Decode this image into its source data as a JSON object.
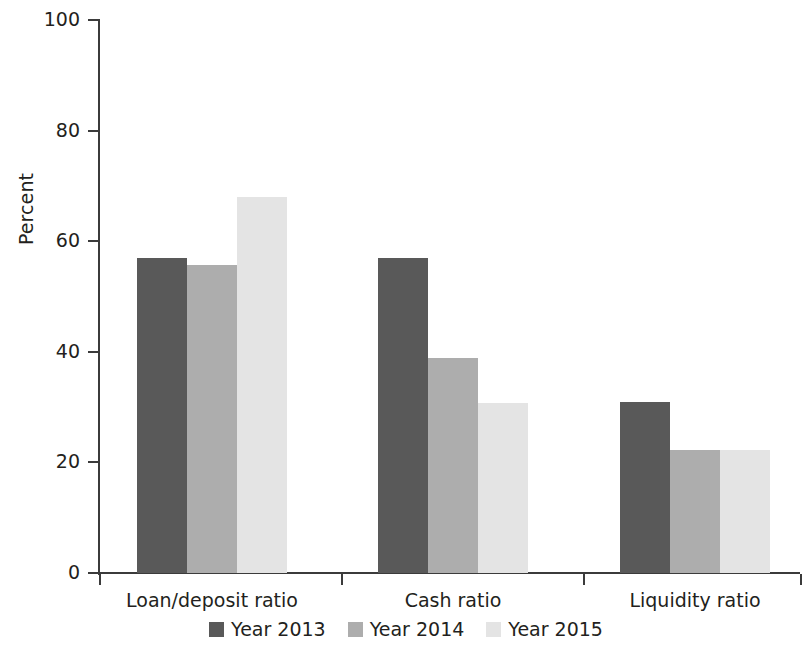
{
  "chart_data": {
    "type": "bar",
    "title": "",
    "subtitle": "",
    "xlabel": "",
    "ylabel": "Percent",
    "ylim": [
      0,
      100
    ],
    "yticks": [
      0,
      20,
      40,
      60,
      80,
      100
    ],
    "ytick_labels": [
      "0",
      "20",
      "40",
      "60",
      "80",
      "100"
    ],
    "grid": false,
    "legend_position": "bottom-center",
    "categories": [
      "Loan/deposit ratio",
      "Cash ratio",
      "Liquidity ratio"
    ],
    "series": [
      {
        "name": "Year 2013",
        "color": "#595959",
        "values": [
          57.0,
          57.0,
          30.9
        ]
      },
      {
        "name": "Year 2014",
        "color": "#adadad",
        "values": [
          55.7,
          38.8,
          22.2
        ]
      },
      {
        "name": "Year 2015",
        "color": "#e4e4e4",
        "values": [
          68.0,
          30.7,
          22.2
        ]
      }
    ]
  },
  "axis": {
    "line_color": "#3b3b3b"
  }
}
